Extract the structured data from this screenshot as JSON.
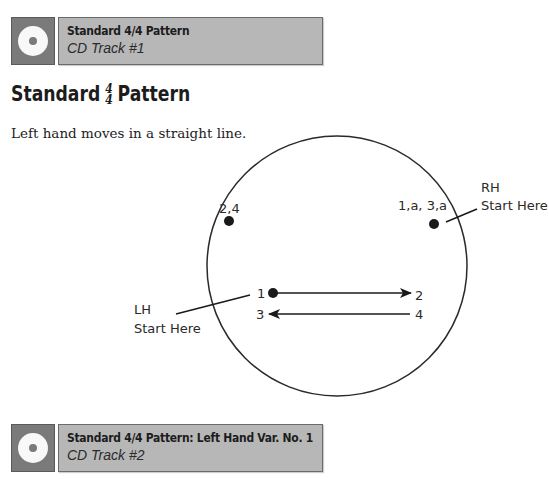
{
  "banners": [
    {
      "title": "Standard 4/4 Pattern",
      "track": "CD Track #1",
      "icon": "cd-icon"
    },
    {
      "title": "Standard 4/4 Pattern: Left Hand Var. No. 1",
      "track": "CD Track #2",
      "icon": "cd-icon"
    }
  ],
  "section": {
    "heading_pre": "Standard",
    "time_sig_top": "4",
    "time_sig_bottom": "4",
    "heading_post": "Pattern",
    "intro": "Left hand moves in a straight line."
  },
  "diagram": {
    "left_dot_label": "2,4",
    "right_dot_label": "1,a, 3,a",
    "rh_label_line1": "RH",
    "rh_label_line2": "Start Here",
    "lh_label_line1": "LH",
    "lh_label_line2": "Start Here",
    "beat_1": "1",
    "beat_2": "2",
    "beat_3": "3",
    "beat_4": "4"
  }
}
